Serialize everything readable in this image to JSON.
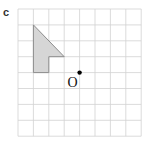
{
  "part_label": "c",
  "grid": {
    "columns": 8,
    "rows": 8
  },
  "shape": {
    "name": "shaded-polygon",
    "vertices_grid": [
      [
        1,
        1
      ],
      [
        3,
        3
      ],
      [
        2,
        3
      ],
      [
        2,
        4
      ],
      [
        1,
        4
      ]
    ],
    "fill": "#d6d6d6",
    "stroke": "#8c8c8c"
  },
  "center_point": {
    "label": "O",
    "grid": [
      4,
      4
    ]
  },
  "colors": {
    "grid_line": "#d2d2d2",
    "point": "#000000"
  }
}
